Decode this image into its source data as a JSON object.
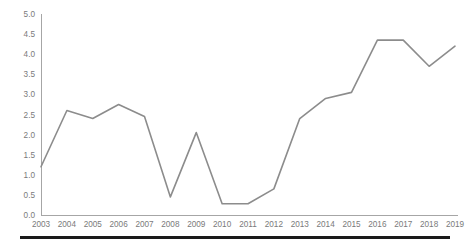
{
  "chart_data": {
    "type": "line",
    "title": "",
    "subtitle": "",
    "xlabel": "",
    "ylabel": "",
    "categories": [
      "2003",
      "2004",
      "2005",
      "2006",
      "2007",
      "2008",
      "2009",
      "2010",
      "2011",
      "2012",
      "2013",
      "2014",
      "2015",
      "2016",
      "2017",
      "2018",
      "2019"
    ],
    "series": [
      {
        "name": "series-1",
        "color": "#8c8c8c",
        "values": [
          1.2,
          2.6,
          2.4,
          2.75,
          2.45,
          0.45,
          2.05,
          0.28,
          0.28,
          0.65,
          2.4,
          2.9,
          3.05,
          4.35,
          4.35,
          3.7,
          4.2
        ]
      }
    ],
    "ylim": [
      0.0,
      5.0
    ],
    "ytick_step": 0.5,
    "ytick_labels": [
      "0.0",
      "0.5",
      "1.0",
      "1.5",
      "2.0",
      "2.5",
      "3.0",
      "3.5",
      "4.0",
      "4.5",
      "5.0"
    ],
    "xtick_labels": [
      "2003",
      "2004",
      "2005",
      "2006",
      "2007",
      "2008",
      "2009",
      "2010",
      "2011",
      "2012",
      "2013",
      "2014",
      "2015",
      "2016",
      "2017",
      "2018",
      "2019"
    ],
    "grid": false,
    "legend": false,
    "legend_position": "none",
    "markers": false,
    "axis_color": "#a6a6a6",
    "tick_label_color": "#7a7a7a",
    "background_color": "#ffffff",
    "rule_color": "#1a1a1a"
  }
}
